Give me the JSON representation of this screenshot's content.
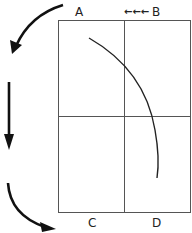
{
  "diagram": {
    "corner_labels": {
      "top_left": "A",
      "top_right": "B",
      "bottom_left": "C",
      "bottom_right": "D"
    },
    "top_arrows": "←←←",
    "colors": {
      "stroke": "#555555",
      "ink": "#111111",
      "background": "#ffffff"
    },
    "elements": [
      {
        "name": "outer-rectangle",
        "description": "rectangle divided into four quadrants"
      },
      {
        "name": "path-arc",
        "description": "curved arc from top-left quadrant sweeping down to bottom-right quadrant"
      },
      {
        "name": "left-arrows",
        "description": "three black arrows on the left side indicating downward motion"
      }
    ]
  }
}
